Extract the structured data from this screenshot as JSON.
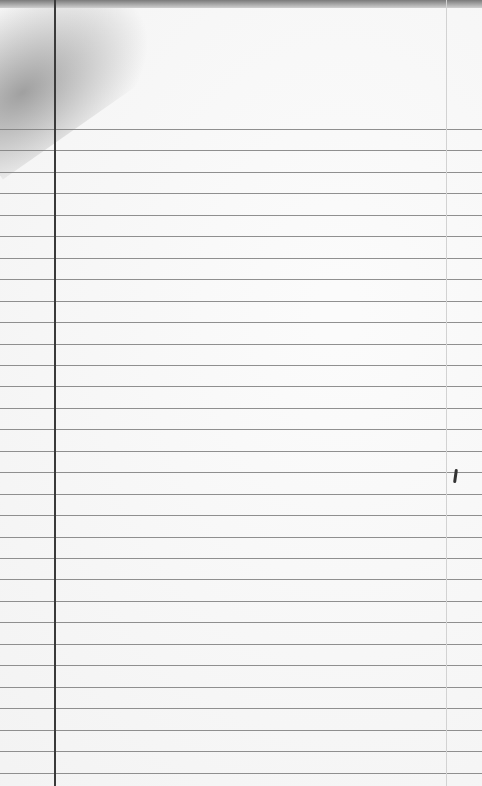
{
  "paper": {
    "type": "lined notepad sheet",
    "rule_start_y": 129,
    "rule_spacing": 21.45,
    "rule_count": 31,
    "margin_x": 55,
    "right_margin_x": 446,
    "colors": {
      "paper": "#f6f6f6",
      "rule": "#7d7d7d",
      "margin": "#3a3a3a"
    }
  }
}
